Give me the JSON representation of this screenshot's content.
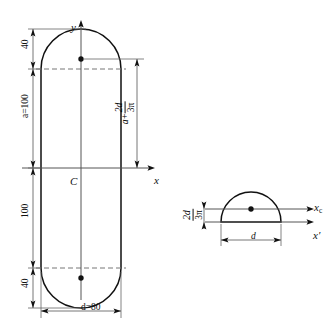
{
  "figure": {
    "title_visible": false,
    "background_color": "#ffffff",
    "line_color": "#111111",
    "thin_line_color": "#555555",
    "dashed_line_color": "#777777",
    "left_figure": {
      "name": "stadium-cross-section",
      "axes": {
        "y_label": "y",
        "x_label": "x"
      },
      "centroid_label": "C",
      "dimensions": [
        {
          "id": "top-cap-height",
          "label": "40",
          "orientation": "vertical"
        },
        {
          "id": "upper-straight-length",
          "label": "a=100",
          "orientation": "vertical"
        },
        {
          "id": "lower-straight-length",
          "label": "100",
          "orientation": "vertical"
        },
        {
          "id": "bottom-cap-height",
          "label": "40",
          "orientation": "vertical"
        },
        {
          "id": "width",
          "label": "d=80",
          "orientation": "horizontal"
        }
      ],
      "centroid_distance": {
        "id": "semicircle-centroid-distance",
        "term": "a",
        "operator": "+",
        "fraction_numerator": "2d",
        "fraction_denominator": "3π",
        "plain": "a + 2d/3π"
      },
      "centroid_marks": [
        {
          "id": "upper-semicircle-centroid"
        },
        {
          "id": "lower-semicircle-centroid"
        }
      ]
    },
    "right_figure": {
      "name": "semicircle-detail",
      "axes": {
        "xc_label": "x",
        "xc_subscript": "c",
        "xprime_label": "x′"
      },
      "dimensions": [
        {
          "id": "diameter",
          "label": "d",
          "orientation": "horizontal"
        }
      ],
      "centroid_distance": {
        "id": "semicircle-centroid-offset",
        "fraction_numerator": "2d",
        "fraction_denominator": "3π",
        "plain": "2d/3π"
      },
      "centroid_marks": [
        {
          "id": "semicircle-centroid"
        }
      ]
    }
  }
}
